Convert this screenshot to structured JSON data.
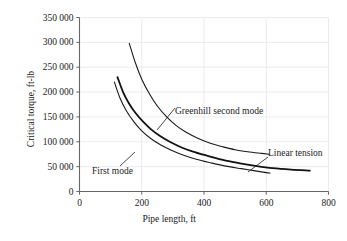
{
  "chart_data": {
    "type": "line",
    "title": "",
    "xlabel": "Pipe length, ft",
    "ylabel": "Critical torque, ft-lb",
    "xlim": [
      0,
      800
    ],
    "ylim": [
      0,
      350000
    ],
    "xticks": [
      0,
      200,
      400,
      600,
      800
    ],
    "yticks": [
      0,
      50000,
      100000,
      150000,
      200000,
      250000,
      300000,
      350000
    ],
    "xtick_labels": [
      "0",
      "200",
      "400",
      "600",
      "800"
    ],
    "ytick_labels": [
      "0",
      "50 000",
      "100 000",
      "150 000",
      "200 000",
      "250 000",
      "300 000",
      "350 000"
    ],
    "grid": true,
    "grid_color": "#e3e3e8",
    "axis_color": "#666666",
    "legend": "annotations",
    "series": [
      {
        "name": "Greenhill second mode",
        "color": "#1a1a1a",
        "line_width": 1.1,
        "points": [
          [
            160,
            298000
          ],
          [
            180,
            258000
          ],
          [
            200,
            226000
          ],
          [
            225,
            196000
          ],
          [
            250,
            172000
          ],
          [
            280,
            150000
          ],
          [
            310,
            133000
          ],
          [
            340,
            120000
          ],
          [
            380,
            107000
          ],
          [
            420,
            97000
          ],
          [
            460,
            90000
          ],
          [
            500,
            84000
          ],
          [
            540,
            80000
          ],
          [
            580,
            77000
          ],
          [
            610,
            75000
          ]
        ]
      },
      {
        "name": "Linear tension",
        "color": "#111111",
        "line_width": 1.8,
        "points": [
          [
            122,
            230000
          ],
          [
            140,
            200000
          ],
          [
            160,
            176000
          ],
          [
            180,
            158000
          ],
          [
            205,
            140000
          ],
          [
            230,
            125000
          ],
          [
            260,
            111000
          ],
          [
            290,
            100000
          ],
          [
            330,
            88000
          ],
          [
            370,
            79000
          ],
          [
            420,
            70000
          ],
          [
            470,
            62000
          ],
          [
            520,
            56000
          ],
          [
            570,
            51000
          ],
          [
            620,
            47000
          ],
          [
            680,
            44000
          ],
          [
            740,
            42000
          ]
        ]
      },
      {
        "name": "First mode",
        "color": "#1a1a1a",
        "line_width": 1.1,
        "points": [
          [
            112,
            220000
          ],
          [
            130,
            188000
          ],
          [
            150,
            163000
          ],
          [
            175,
            140000
          ],
          [
            200,
            122000
          ],
          [
            230,
            106000
          ],
          [
            260,
            94000
          ],
          [
            295,
            83000
          ],
          [
            330,
            74000
          ],
          [
            375,
            65000
          ],
          [
            420,
            58000
          ],
          [
            470,
            51000
          ],
          [
            520,
            46000
          ],
          [
            560,
            42000
          ],
          [
            600,
            38000
          ],
          [
            612,
            37000
          ]
        ]
      }
    ],
    "annotations": [
      {
        "name": "Greenhill second mode",
        "text": "Greenhill second mode",
        "leader_from": [
          175,
          108
        ],
        "leader_to": [
          157,
          130
        ]
      },
      {
        "name": "Linear tension",
        "text": "Linear tension",
        "leader_from": [
          268,
          157
        ],
        "leader_to": [
          248,
          172
        ]
      },
      {
        "name": "First mode",
        "text": "First mode",
        "leader_from": [
          120,
          166
        ],
        "leader_to": [
          135,
          152
        ]
      }
    ]
  }
}
